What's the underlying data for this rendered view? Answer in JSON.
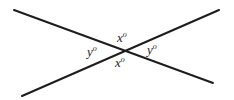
{
  "figure": {
    "kind": "geometry-diagram",
    "width": 234,
    "height": 100,
    "background_color": "#ffffff",
    "line_color": "#1d1d1d",
    "line_width": 2
  },
  "lines": [
    {
      "name": "line-descending",
      "from": {
        "x": 14,
        "y": 10
      },
      "to": {
        "x": 213,
        "y": 83
      }
    },
    {
      "name": "line-ascending",
      "from": {
        "x": 22,
        "y": 96
      },
      "to": {
        "x": 219,
        "y": 10
      }
    }
  ],
  "intersection": {
    "x": 123,
    "y": 50
  },
  "labels": {
    "top": {
      "variable": "x",
      "degree_symbol": "o",
      "x": 117,
      "y": 31
    },
    "left": {
      "variable": "y",
      "degree_symbol": "o",
      "x": 87,
      "y": 45
    },
    "right": {
      "variable": "y",
      "degree_symbol": "o",
      "x": 147,
      "y": 43
    },
    "bottom": {
      "variable": "x",
      "degree_symbol": "o",
      "x": 115,
      "y": 56
    }
  }
}
